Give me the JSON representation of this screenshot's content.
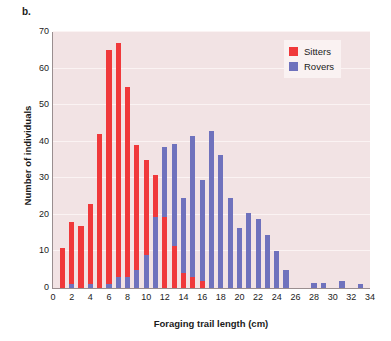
{
  "panel": {
    "label": "b."
  },
  "legend": {
    "position": "top-right",
    "entries": [
      {
        "name": "Sitters",
        "color": "#f0393b"
      },
      {
        "name": "Rovers",
        "color": "#6f72bd"
      }
    ]
  },
  "chart_data": {
    "type": "bar",
    "subtype": "stacked-histogram",
    "title": "",
    "subtitle": "",
    "xlabel": "Foraging trail length (cm)",
    "ylabel": "Number of individuals",
    "xlim": [
      0,
      34
    ],
    "ylim": [
      0,
      70
    ],
    "xticks": [
      0,
      2,
      4,
      6,
      8,
      10,
      12,
      14,
      16,
      18,
      20,
      22,
      24,
      26,
      28,
      30,
      32,
      34
    ],
    "yticks": [
      0,
      10,
      20,
      30,
      40,
      50,
      60,
      70
    ],
    "grid": true,
    "grid_axis": "y",
    "plot_background": "#f2e3e4",
    "x": [
      1,
      2,
      3,
      4,
      5,
      6,
      7,
      8,
      9,
      10,
      11,
      12,
      13,
      14,
      15,
      16,
      17,
      18,
      19,
      20,
      21,
      22,
      23,
      24,
      25,
      26,
      27,
      28,
      29,
      30,
      31,
      32,
      33
    ],
    "categories": [
      "1",
      "2",
      "3",
      "4",
      "5",
      "6",
      "7",
      "8",
      "9",
      "10",
      "11",
      "12",
      "13",
      "14",
      "15",
      "16",
      "17",
      "18",
      "19",
      "20",
      "21",
      "22",
      "23",
      "24",
      "25",
      "26",
      "27",
      "28",
      "29",
      "30",
      "31",
      "32",
      "33"
    ],
    "series": [
      {
        "name": "Sitters",
        "color": "#f0393b",
        "values": [
          11,
          18,
          17,
          23,
          42,
          65,
          67,
          55,
          39,
          35,
          31,
          19.5,
          11.5,
          4,
          3,
          2,
          0,
          0,
          0,
          0,
          0,
          0,
          0,
          0,
          0,
          0,
          0,
          0,
          0,
          0,
          0,
          0,
          0
        ]
      },
      {
        "name": "Rovers",
        "color": "#6f72bd",
        "values": [
          0,
          1,
          0,
          1,
          0,
          1,
          3,
          3,
          5,
          9,
          19.5,
          38.5,
          39.5,
          24.5,
          41.5,
          29.5,
          43,
          36.5,
          24.5,
          16.5,
          20.5,
          19,
          14.5,
          10,
          5,
          0,
          0,
          1.5,
          1.5,
          0,
          2,
          0,
          1
        ]
      }
    ],
    "stacked_totals": [
      11,
      18,
      17,
      23,
      42,
      65,
      67,
      55,
      39,
      35,
      31,
      19.5,
      39.5,
      24.5,
      41.5,
      29.5,
      43,
      36.5,
      24.5,
      16.5,
      20.5,
      19,
      14.5,
      10,
      5,
      0,
      0,
      1.5,
      1.5,
      0,
      2,
      0,
      1
    ]
  }
}
